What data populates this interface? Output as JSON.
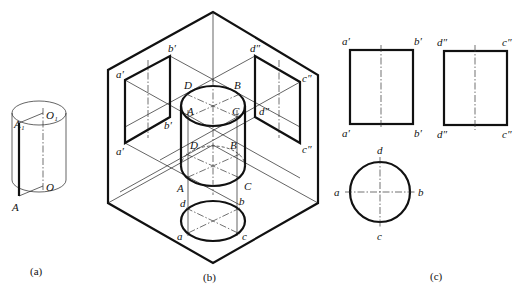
{
  "figure": {
    "panels": [
      {
        "id": "a",
        "caption": "(a)",
        "description": "Isometric cylinder with generator line AA1 and axis OO1",
        "labels": {
          "A1": "A₁",
          "O1": "O₁",
          "O": "O",
          "A": "A"
        }
      },
      {
        "id": "b",
        "caption": "(b)",
        "description": "Cylinder placed in three-projection-plane system showing projections",
        "labels": {
          "a_prime_top": "a′",
          "b_prime_top": "b′",
          "a_prime_bottom": "a′",
          "b_prime_bottom": "b′",
          "d_dprime_top": "d″",
          "c_dprime_top": "c″",
          "d_dprime_bottom": "d″",
          "c_dprime_bottom": "c″",
          "D_top": "D",
          "B_top": "B",
          "A_top": "A",
          "C_top": "C",
          "D_bottom": "D",
          "B_bottom": "B",
          "A_bottom": "A",
          "C_bottom": "C",
          "d": "d",
          "b": "b",
          "a": "a",
          "c": "c"
        }
      },
      {
        "id": "c",
        "caption": "(c)",
        "description": "Orthographic three views of the cylinder",
        "labels": {
          "front_a_top": "a′",
          "front_b_top": "b′",
          "front_a_bottom": "a′",
          "front_b_bottom": "b′",
          "side_d_top": "d″",
          "side_c_top": "c″",
          "side_d_bottom": "d″",
          "side_c_bottom": "c″",
          "top_d": "d",
          "top_a": "a",
          "top_b": "b",
          "top_c": "c"
        }
      }
    ]
  }
}
